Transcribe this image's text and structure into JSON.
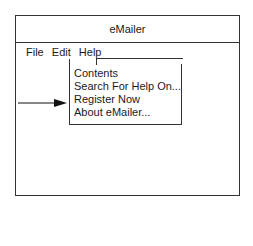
{
  "window": {
    "title": "eMailer"
  },
  "menubar": {
    "items": [
      {
        "label": "File"
      },
      {
        "label": "Edit"
      },
      {
        "label": "Help"
      }
    ]
  },
  "help_menu": {
    "items": [
      {
        "label": "Contents"
      },
      {
        "label": "Search For Help On..."
      },
      {
        "label": "Register Now"
      },
      {
        "label": "About eMailer..."
      }
    ]
  },
  "annotation": {
    "arrow_icon": "right-arrow-icon",
    "points_to": "Register Now"
  }
}
